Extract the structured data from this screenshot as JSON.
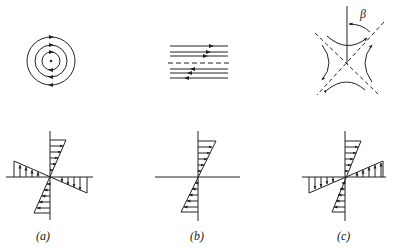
{
  "figure": {
    "panels": [
      {
        "id": "a",
        "label": "(a)",
        "flow_pattern": "concentric circular streamlines (rigid rotation)",
        "velocity_profile": "both axes sheared: rotation"
      },
      {
        "id": "b",
        "label": "(b)",
        "flow_pattern": "parallel shear streamlines with dashed centerline",
        "velocity_profile": "simple shear along vertical axis"
      },
      {
        "id": "c",
        "label": "(c)",
        "flow_pattern": "hyperbolic streamlines around dashed asymptotes",
        "velocity_profile": "pure strain (opposite signs)",
        "angle_symbol": "β"
      }
    ],
    "stroke_color": "#222222",
    "background": "#ffffff"
  }
}
